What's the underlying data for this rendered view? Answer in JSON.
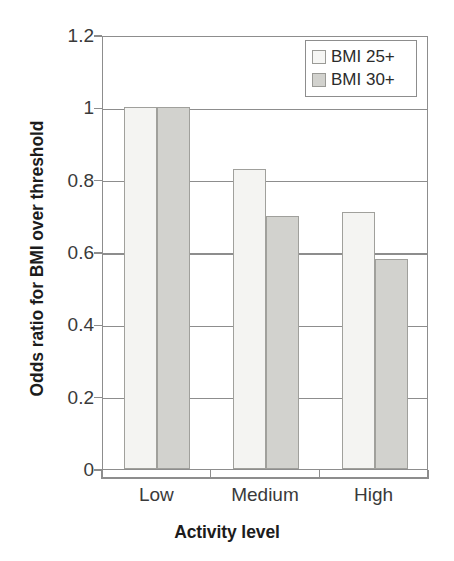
{
  "chart_data": {
    "type": "bar",
    "title": "",
    "xlabel": "Activity level",
    "ylabel": "Odds ratio for BMI over threshold",
    "categories": [
      "Low",
      "Medium",
      "High"
    ],
    "series": [
      {
        "name": "BMI 25+",
        "color": "#f4f4f2",
        "values": [
          1,
          0.83,
          0.71
        ]
      },
      {
        "name": "BMI 30+",
        "color": "#d2d2ce",
        "values": [
          1,
          0.7,
          0.58
        ]
      }
    ],
    "ylim": [
      0,
      1.2
    ],
    "ytick_labels": [
      "1.2",
      "1",
      "0.8",
      "0.6",
      "0.4",
      "0.2",
      "0"
    ],
    "ytick_values": [
      1.2,
      1,
      0.8,
      0.6,
      0.4,
      0.2,
      0
    ],
    "grid": true,
    "legend_position": "top-right"
  },
  "axes": {
    "y_title": "Odds ratio for BMI over threshold",
    "x_title": "Activity level"
  },
  "legend": {
    "entries": [
      {
        "label": "BMI 25+",
        "swatch": "legend-swatch-bmi-25"
      },
      {
        "label": "BMI 30+",
        "swatch": "legend-swatch-bmi-30"
      }
    ]
  }
}
